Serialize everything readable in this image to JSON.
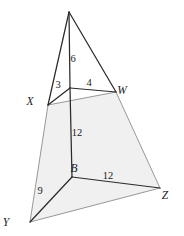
{
  "figure": {
    "type": "pyramid-with-quadrilateral-base",
    "colors": {
      "stroke_dark": "#2b2b2b",
      "stroke_light": "#8c8c8c",
      "fill_shaded": "#f0f0f0",
      "label_color": "#1a1a1a",
      "background": "#ffffff"
    },
    "vertices": [
      {
        "id": "P",
        "label": "",
        "x": 69,
        "y": 12,
        "label_x": 69,
        "label_y": 8
      },
      {
        "id": "A",
        "label": "",
        "x": 70,
        "y": 88,
        "label_x": 70,
        "label_y": 84
      },
      {
        "id": "X",
        "label": "X",
        "x": 48,
        "y": 105,
        "label_x": 30,
        "label_y": 105
      },
      {
        "id": "W",
        "label": "W",
        "x": 116,
        "y": 92,
        "label_x": 122,
        "label_y": 94
      },
      {
        "id": "B",
        "label": "B",
        "x": 72,
        "y": 177,
        "label_x": 74,
        "label_y": 172
      },
      {
        "id": "Y",
        "label": "Y",
        "x": 30,
        "y": 222,
        "label_x": 6,
        "label_y": 226
      },
      {
        "id": "Z",
        "label": "Z",
        "x": 160,
        "y": 188,
        "label_x": 165,
        "label_y": 199
      }
    ],
    "edges": [
      {
        "id": "P-X",
        "from": "P",
        "to": "X",
        "weight": "dark"
      },
      {
        "id": "P-A",
        "from": "P",
        "to": "A",
        "weight": "dark"
      },
      {
        "id": "P-W",
        "from": "P",
        "to": "W",
        "weight": "dark"
      },
      {
        "id": "A-X",
        "from": "A",
        "to": "X",
        "weight": "dark"
      },
      {
        "id": "A-W",
        "from": "A",
        "to": "W",
        "weight": "dark"
      },
      {
        "id": "A-B",
        "from": "A",
        "to": "B",
        "weight": "dark"
      },
      {
        "id": "B-Y",
        "from": "B",
        "to": "Y",
        "weight": "dark"
      },
      {
        "id": "B-Z",
        "from": "B",
        "to": "Z",
        "weight": "dark"
      },
      {
        "id": "X-W",
        "from": "X",
        "to": "W",
        "weight": "light"
      },
      {
        "id": "X-Y",
        "from": "X",
        "to": "Y",
        "weight": "light"
      },
      {
        "id": "W-Z",
        "from": "W",
        "to": "Z",
        "weight": "light"
      },
      {
        "id": "Y-Z",
        "from": "Y",
        "to": "Z",
        "weight": "light"
      }
    ],
    "shaded_face": {
      "id": "base-quadrilateral",
      "points": "48,105 116,92 160,188 30,222"
    },
    "measurements": [
      {
        "id": "PA",
        "value": "6",
        "x": 73,
        "y": 62,
        "edge": "P-A"
      },
      {
        "id": "AX",
        "value": "3",
        "x": 58,
        "y": 88,
        "edge": "A-X"
      },
      {
        "id": "AW",
        "value": "4",
        "x": 89,
        "y": 86,
        "edge": "A-W"
      },
      {
        "id": "AB",
        "value": "12",
        "x": 77,
        "y": 136,
        "edge": "A-B"
      },
      {
        "id": "BZ",
        "value": "12",
        "x": 108,
        "y": 179,
        "edge": "B-Z"
      },
      {
        "id": "BY",
        "value": "9",
        "x": 40,
        "y": 194,
        "edge": "B-Y"
      }
    ]
  }
}
